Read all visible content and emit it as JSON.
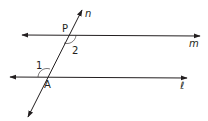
{
  "diagram": {
    "type": "parallel-lines-cut-by-transversal",
    "lines": {
      "m": {
        "label": "m",
        "italic": true
      },
      "l": {
        "label": "ℓ",
        "italic": true
      },
      "n": {
        "label": "n",
        "italic": true
      }
    },
    "points": {
      "P": {
        "label": "P"
      },
      "A": {
        "label": "A"
      }
    },
    "angles": {
      "angle1": {
        "label": "1"
      },
      "angle2": {
        "label": "2"
      }
    },
    "colors": {
      "stroke": "#231f20",
      "background": "#ffffff"
    }
  }
}
